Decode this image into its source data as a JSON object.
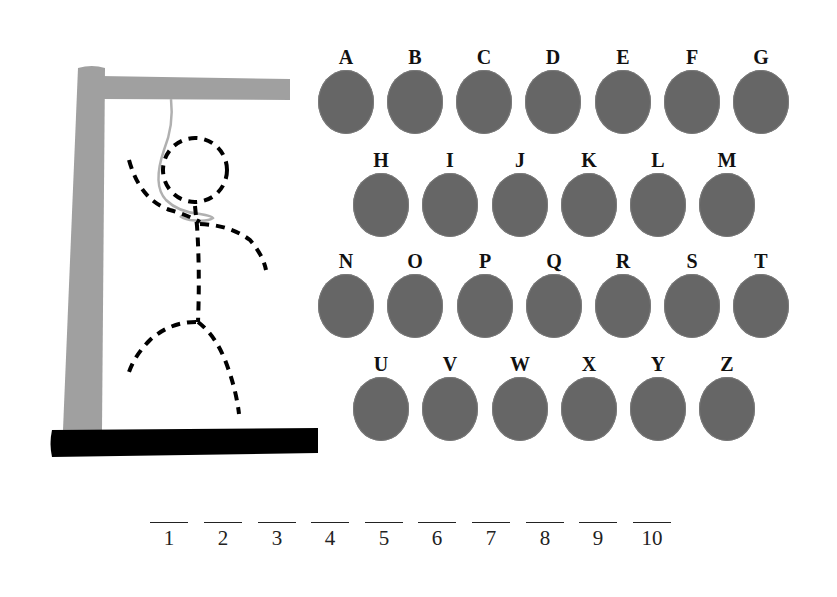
{
  "game": {
    "type": "hangman",
    "colors": {
      "gallows": "#a0a0a0",
      "base": "#000000",
      "figure": "#000000",
      "rope": "#b0b0b0",
      "letter_disc": "#666666",
      "letter_text": "#111111"
    }
  },
  "keyboard": {
    "rows": [
      {
        "y": 48,
        "letters": [
          {
            "label": "A",
            "x": 318
          },
          {
            "label": "B",
            "x": 387
          },
          {
            "label": "C",
            "x": 456
          },
          {
            "label": "D",
            "x": 525
          },
          {
            "label": "E",
            "x": 594
          },
          {
            "label": "F",
            "x": 664
          },
          {
            "label": "G",
            "x": 733
          }
        ]
      },
      {
        "y": 148,
        "letters": [
          {
            "label": "H",
            "x": 353
          },
          {
            "label": "I",
            "x": 422
          },
          {
            "label": "J",
            "x": 491
          },
          {
            "label": "K",
            "x": 560
          },
          {
            "label": "L",
            "x": 629
          },
          {
            "label": "M",
            "x": 699
          }
        ]
      },
      {
        "y": 250,
        "letters": [
          {
            "label": "N",
            "x": 318
          },
          {
            "label": "O",
            "x": 387
          },
          {
            "label": "Q_placeholder",
            "x": 0
          }
        ]
      }
    ],
    "letters": [
      "A",
      "B",
      "C",
      "D",
      "E",
      "F",
      "G",
      "H",
      "I",
      "J",
      "K",
      "L",
      "M",
      "N",
      "O",
      "P",
      "Q",
      "R",
      "S",
      "T",
      "U",
      "V",
      "W",
      "X",
      "Y",
      "Z"
    ]
  },
  "letters": {
    "A": "A",
    "B": "B",
    "C": "C",
    "D": "D",
    "E": "E",
    "F": "F",
    "G": "G",
    "H": "H",
    "I": "I",
    "J": "J",
    "K": "K",
    "L": "L",
    "M": "M",
    "N": "N",
    "O": "O",
    "P": "P",
    "Q": "Q",
    "R": "R",
    "S": "S",
    "T": "T",
    "U": "U",
    "V": "V",
    "W": "W",
    "X": "X",
    "Y": "Y",
    "Z": "Z"
  },
  "word_slots": {
    "count": 10,
    "labels": [
      "1",
      "2",
      "3",
      "4",
      "5",
      "6",
      "7",
      "8",
      "9",
      "10"
    ]
  }
}
